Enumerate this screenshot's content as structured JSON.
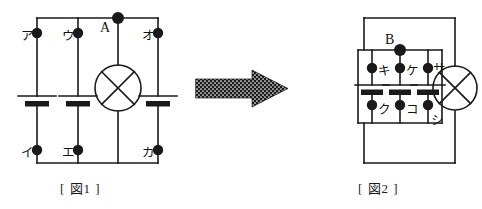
{
  "figures": [
    {
      "id": "figure-1",
      "caption": "[ 図1 ]",
      "components": {
        "lamp_count": 1,
        "battery_count": 3
      },
      "terminals": [
        {
          "key": "a",
          "label": "ア",
          "x": 37,
          "y": 33,
          "label_dx": -16,
          "label_dy": -8
        },
        {
          "key": "u",
          "label": "ウ",
          "x": 78,
          "y": 33,
          "label_dx": -16,
          "label_dy": -8
        },
        {
          "key": "o",
          "label": "オ",
          "x": 158,
          "y": 33,
          "label_dx": -16,
          "label_dy": -8
        },
        {
          "key": "i",
          "label": "イ",
          "x": 37,
          "y": 150,
          "label_dx": -16,
          "label_dy": -8
        },
        {
          "key": "e",
          "label": "エ",
          "x": 78,
          "y": 150,
          "label_dx": -16,
          "label_dy": -8
        },
        {
          "key": "ka",
          "label": "カ",
          "x": 158,
          "y": 150,
          "label_dx": -16,
          "label_dy": -8
        }
      ],
      "junctions": [
        {
          "key": "A",
          "label": "A",
          "x": 118,
          "y": 18,
          "label_dx": -18,
          "label_dy": -2
        }
      ]
    },
    {
      "id": "figure-2",
      "caption": "[ 図2 ]",
      "components": {
        "lamp_count": 1,
        "battery_count": 3
      },
      "terminals": [
        {
          "key": "ki",
          "label": "キ",
          "x": 372,
          "y": 68,
          "label_dx": 4,
          "label_dy": -8
        },
        {
          "key": "ke",
          "label": "ケ",
          "x": 400,
          "y": 68,
          "label_dx": 4,
          "label_dy": -8
        },
        {
          "key": "sa",
          "label": "サ",
          "x": 428,
          "y": 68,
          "label_dx": 4,
          "label_dy": -9
        },
        {
          "key": "ku",
          "label": "ク",
          "x": 372,
          "y": 105,
          "label_dx": 4,
          "label_dy": -6
        },
        {
          "key": "ko",
          "label": "コ",
          "x": 400,
          "y": 105,
          "label_dx": 4,
          "label_dy": -6
        },
        {
          "key": "shi",
          "label": "シ",
          "x": 428,
          "y": 105,
          "label_dx": 2,
          "label_dy": 2
        }
      ],
      "junctions": [
        {
          "key": "B",
          "label": "B",
          "x": 400,
          "y": 50,
          "label_dx": -16,
          "label_dy": -4
        }
      ]
    }
  ],
  "arrow": {
    "name": "transform-arrow",
    "direction": "right"
  },
  "style": {
    "ink": "#1a1a1a",
    "paper": "#ffffff"
  }
}
